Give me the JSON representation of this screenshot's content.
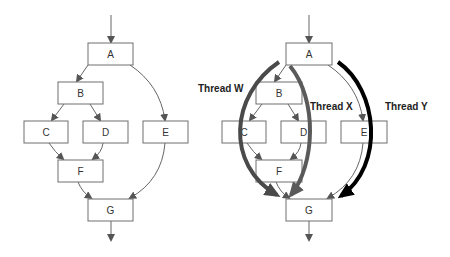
{
  "left_graph": {
    "nodes": [
      {
        "id": "A",
        "label": "A"
      },
      {
        "id": "B",
        "label": "B"
      },
      {
        "id": "C",
        "label": "C"
      },
      {
        "id": "D",
        "label": "D"
      },
      {
        "id": "E",
        "label": "E"
      },
      {
        "id": "F",
        "label": "F"
      },
      {
        "id": "G",
        "label": "G"
      }
    ],
    "edges": [
      [
        "entry",
        "A"
      ],
      [
        "A",
        "B"
      ],
      [
        "A",
        "E"
      ],
      [
        "B",
        "C"
      ],
      [
        "B",
        "D"
      ],
      [
        "C",
        "F"
      ],
      [
        "D",
        "F"
      ],
      [
        "F",
        "G"
      ],
      [
        "E",
        "G"
      ],
      [
        "G",
        "exit"
      ]
    ]
  },
  "right_graph": {
    "nodes": [
      {
        "id": "A",
        "label": "A"
      },
      {
        "id": "B",
        "label": "B"
      },
      {
        "id": "C",
        "label": "C"
      },
      {
        "id": "D",
        "label": "D"
      },
      {
        "id": "E",
        "label": "E"
      },
      {
        "id": "F",
        "label": "F"
      },
      {
        "id": "G",
        "label": "G"
      }
    ],
    "threads": [
      {
        "label": "Thread W",
        "color": "#4a4a4a",
        "path": [
          "A",
          "B",
          "C",
          "F",
          "G"
        ]
      },
      {
        "label": "Thread X",
        "color": "#5a5a5a",
        "path": [
          "A",
          "B",
          "D",
          "F",
          "G"
        ]
      },
      {
        "label": "Thread Y",
        "color": "#000000",
        "path": [
          "A",
          "E",
          "G"
        ]
      }
    ]
  },
  "colors": {
    "node_border": "#6e6e6e",
    "edge": "#666666",
    "thread_w": "#4a4a4a",
    "thread_x": "#5a5a5a",
    "thread_y": "#000000"
  }
}
